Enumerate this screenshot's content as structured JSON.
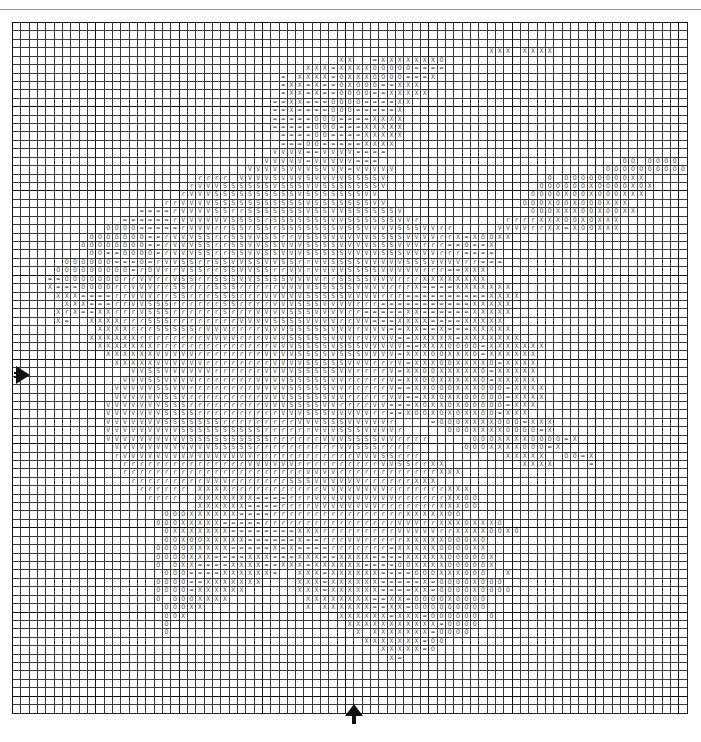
{
  "chart_title": "",
  "grid": {
    "columns": 81,
    "rows": 82,
    "major_line_every": 10
  },
  "legend_symbols": [
    "X",
    "=",
    "O",
    "V",
    "S",
    "r"
  ],
  "center_markers": {
    "left": "center-row-arrow",
    "bottom": "center-column-arrow"
  },
  "rows": [
    ".................................................................................",
    ".................................................................................",
    ".................................................................................",
    ".........................................................XXX.XXXX................",
    ".......................................XX..=XXXXXXXO.....................................",
    "...................................XXX=XXXXOOOOO====.............................",
    "................................=.XXXX=OXXXOOOO===X..............................",
    "................................=XX=X==OXOOO==XXX................................",
    "................................=XX=X==OOOO==XXXXX...............................",
    "...............................==XX===OOOO====XX.................................",
    "...............................==X====OOO=====X..................................",
    "...............................=====OOO====XXXX..................................",
    "...............................=====OOO===XXXXX..................................",
    "................................====OO====XXXXX..................................",
    "................................===OO=====XXXX...................................",
    "...............................VVVV==VVVV====....................................",
    "..............................VVVVV=VVVVV===.............................OO.OOOO.",
    "............................VVVVSVVVSVVV=VVVVV.........................OOOOOOOOOOOO",
    "......................rrrr.VVVVSVVVSVVVVSSSSV...................O.OOOOOOOOXX......",
    ".....................rVVVSSSSSSVSSSVVSSSSSSSV..................OOOOOOXOOOOXOX.....",
    "....................rVVVSSSSSSSSSSVSSSSSSSVV..................OOOOXOOXOOOXXX.....",
    "..................rrVVVVSSSSSSSSSSSVSSSSSSSVV................OOOXOOXOOOXXX.......",
    "...............====rVVVVSSrrSSSSSSSVSSVVSSSSSSV...............OOOXXXOOXOOXX......",
    ".............======rVVVVVVSSSSrSSSSSSSVVSSSSSSVVr..........rrrrXXXOOXOXXX......",
    "...........OOOO=====rVVVrrSSrSSrSSSSSSSVSSVVVVSSSVVrr.....VVVVrrXX=XOOXXX......",
    ".........OOOOOOO==rVVVSSrrSSVVSSrrVSSSVVVVVSSSSVVVVrrX=XOOXX......",
    "........OOOOOOOO==rVVVSSrrSSVVSSVVVSSSSVVVVSSSVVVrrr==O==X.........",
    ".........OO==OOOO=rVVVSSrrSSVVSSVVVSSSSSVVVVSSSVVVVrrr====..........",
    "......OOOOOO===O=rVVSSrrSSVVSSVVSSrrVVSSSSVVVVVSSSVVVVrr===.........",
    ".....OOOOOOOOO=rOVrrVSSrrSSVVSSrrVVrVVVVSSSSVVVVVrrr==XXX.......",
    "....==OOOOOOOrrVVrrVSSrrSSSVVSSSSVVVVrrSSSSVVVrrrXXXXXXXX....",
    "....X===OOOOrrVVVrrSSrrrSSSrrrrrVVVVSSSSSVVVVrrrX====XXXXXXX",
    ".....XXX====rrVVVrrSSrrrSSSrrrVVVVVSSSSSVVVVrrr==========XXXX",
    "......XXX===rrVVSSSrrrrrrSSrrrrVVVSSSVVVVrrr===========XXXXX",
    ".....XrX==XXrrrVSSSrrrrrrSrrrVVVVSSSVVVVrr=====XX======XXXXX",
    ".....X=..XXXXrrrSSSrrrrrrrrVVVVSSSSVVVVrrVV===XXXX====XXXXX",
    "..........XXXXrrrSSSSSrVVVrrrrVVVSSSSSVVVrVVV==XX==X===XXXXX",
    ".........XXXXXXrrrrrrrrVVVVrrrVVVSSSSSVVVrVVVV==XXXXX=XXXXXXX",
    "..........XXXXXXXrrrrrrrrrrrrrrVVVSSSSVSSSVVVVV==XXXOOOO=XXXXXXX",
    "...........XXXXXXVVVVVrrrrrrrrVVVVSSSSVSSSVVVV=XXXOOXXXO=XXXXXX",
    "............XXXXXVVVVVVrrrrrrrrVVVVSSSSSVVVrrrV=XXXOOXXXXO=XXXX",
    "..............VVSSVVVVVVrrrrrrVVVVSSSSSVVrrrrV=XXOOXXXXXO=XXXXX",
    ".............VVVSSVVVVrrrrrrrVVVVSSSSSVVrrrrrV=XXOOXXXXXO=XXXXX",
    "............VVVVVSSVVrrrrrrrrVVVVSSSSSVVrrrrrV==XXOOOXXXOOO=XXXX",
    "............VVVVVVSSVrrrrrrrrrVVVSSSSSVVrrrrrVV==XXOXXOOOOO=XXXX",
    "...........VVVVVVVSSSrrrrrrrrrVVVSSSSVVrrrrVV===XOXXOXOOOOO=XXX",
    "...........VVVVVVVSSSSrrrrrrrrrrVVVSSSVVVVVrr==XOOXOXOXXOO=XXX",
    "...........VVVVVVVSSSSSSSrrrrrrrrrVVVSSSVVVVVr....=OOOXXXXOOO=XXX",
    "...........VVVVVVVVVSSSSSSSSSSrrrrrrVVVSSSVVVVr.....OOOXXXXOOOO=X",
    "...........VVVVVVVVVVSSSSSSSSSSrrrrrrVVVSSSSVVrrrr.....OOOXXXXOOOO=X",
    "............VVVVVVVVVVVVSSSSSrrrrrrrrrrVVSSSrrrr......OOOXXXXOOO=X",
    "............rVVVVVVVVVVVVVVVVrrrrrrrrrrrrVVVSSrrr..........XXXXX..OO=X",
    ".............rrrrrrrrrrrrrrrVVVVVVrrrrrrrrrrVVSSrrXX.........XXXX....=",
    ".............rrrrrrrrrrrrrrrrrrrrrrVVVVrrrrrrrrrrrrXXX..................",
    "..............rrrrrrrrrVVVrrrrrrrSSSVVVVVVrrrrrrXXX.......................",
    "...............rrrrrr.XXXXrrrrrrrrrrrVVVVVVVVrrrrrrrXXX......................",
    "................rrrr..XXXXXXX====rrrVVVVVVVVVVrrrrrrXXOO.....................",
    "......................XXXXXX====rrrrVVVVVVVVrrrrrrrXXXOO.....................",
    "..................OOOXXXXXX====rrrrrrrrrrrrrrrrXXXXXOO.......................",
    ".................OOOXXXXX=====rrrrrrrrrrrrrrrrVVVrrXXXOXXXO..................",
    "..................OXXXXXXX========XXXrrrrrrrrrVVVVVrrXXXXOOXO................",
    "..................OOXOOXXXXX======X==rrrVVrrrrrXXXXXOOOXO....................",
    ".................OOOOXXXXX=====X=X====rrrrrrr=XXXXXOOOOXX....................",
    ".................OOOOXXX====XXX===XXX==XXXX====XXXXXOOOOOX...................",
    ".................O.OXX====XXXX==XXX=XXXXXX====OOXXXXOOOOOX...................",
    "..................OOO====XXXXXX=..XXX=XXXXXX====OOOXXXOOO..X.................",
    ".................OOOO==XXXXXXX....XXX=XXXXXX=====X=OOOOXOOO..................",
    ".................OOOO=XXXXXX......XXX=XXXXXX====XX=OOOOXOOOO.................",
    ".................O.OOOXXXX.........XXXXXXXX==XX=OOOOXOOOO....................",
    "..................OOOXX............X.XXXXXX==XX=OOOOOOOOO....................",
    "..................OOX..................XXXXXX=XXX=OOOOOO.O....................",
    "..................O.....................XXXXXXXXXXX=OOOO......................",
    "..................O......................X.XXXXXXX=OOOO.......................",
    "..........................................XXXXXXX=OO.........................",
    "............................................XXXXX=O..........................",
    ".............................................X=...............................",
    ".................................................................................",
    ".................................................................................",
    "................................................................................."
  ]
}
